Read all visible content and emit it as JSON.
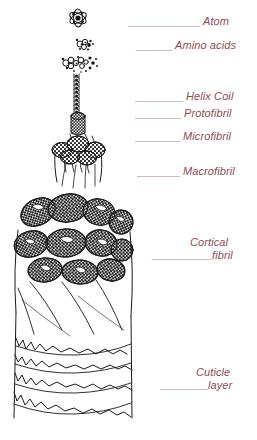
{
  "figure": {
    "text_color": "#8f4a52",
    "leader_color": "#d9b6ba",
    "ink_color": "#1a1a1a",
    "background": "#ffffff"
  },
  "labels": [
    {
      "id": "atom",
      "text": "Atom",
      "line2": ""
    },
    {
      "id": "amino-acids",
      "text": "Amino acids",
      "line2": ""
    },
    {
      "id": "helix-coil",
      "text": "Helix Coil",
      "line2": ""
    },
    {
      "id": "protofibril",
      "text": "Protofibril",
      "line2": ""
    },
    {
      "id": "microfibril",
      "text": "Microfibril",
      "line2": ""
    },
    {
      "id": "macrofibril",
      "text": "Macrofibril",
      "line2": ""
    },
    {
      "id": "cortical-fibril",
      "text": "Cortical",
      "line2": "fibril"
    },
    {
      "id": "cuticle-layer",
      "text": "Cuticle",
      "line2": "layer"
    }
  ],
  "structures": [
    {
      "id": "atom-glyph",
      "name": "atom"
    },
    {
      "id": "amino-acid-cluster",
      "name": "amino acids"
    },
    {
      "id": "helix-coil-strand",
      "name": "helix coil"
    },
    {
      "id": "protofibril-bundle",
      "name": "protofibril"
    },
    {
      "id": "microfibril-bundle",
      "name": "microfibril"
    },
    {
      "id": "macrofibril-mass",
      "name": "macrofibril"
    },
    {
      "id": "cortical-fibril-body",
      "name": "cortical fibril"
    },
    {
      "id": "cuticle-scales",
      "name": "cuticle layer"
    }
  ]
}
